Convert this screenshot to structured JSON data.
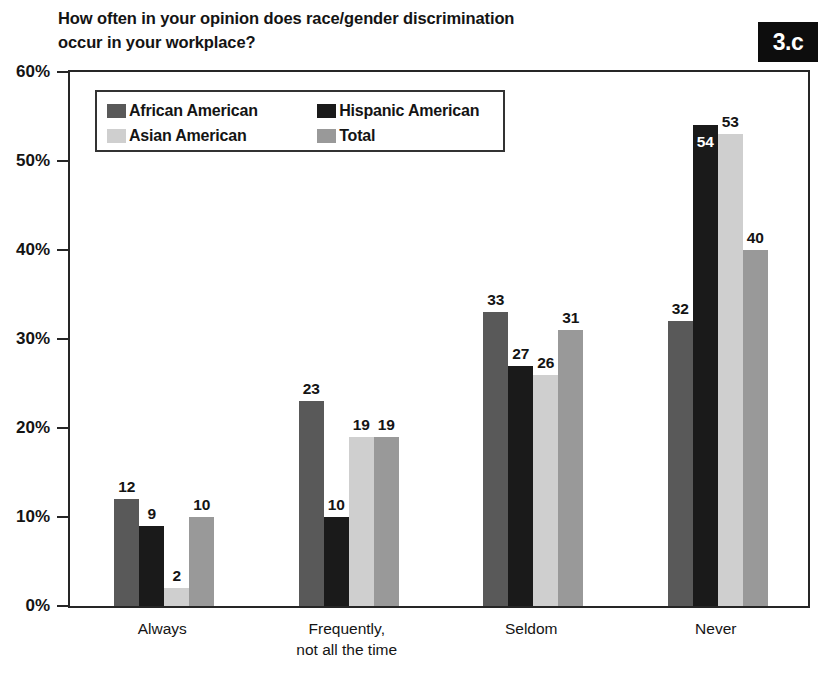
{
  "header": {
    "title": "How often in your opinion does race/gender discrimination\noccur in your workplace?",
    "badge": "3.c"
  },
  "legend": {
    "position": "inside-top-left",
    "entries": [
      {
        "label": "African American",
        "color": "#595959"
      },
      {
        "label": "Hispanic American",
        "color": "#1a1a1a"
      },
      {
        "label": "Asian American",
        "color": "#cfcfcf"
      },
      {
        "label": "Total",
        "color": "#999999"
      }
    ]
  },
  "axes": {
    "y_ticks": [
      "0%",
      "10%",
      "20%",
      "30%",
      "40%",
      "50%",
      "60%"
    ],
    "y_tick_values": [
      0,
      10,
      20,
      30,
      40,
      50,
      60
    ],
    "x_ticks": [
      "Always",
      "Frequently,\nnot all the time",
      "Seldom",
      "Never"
    ]
  },
  "chart_data": {
    "type": "bar",
    "title": "How often in your opinion does race/gender discrimination occur in your workplace?",
    "xlabel": "",
    "ylabel": "",
    "ylim": [
      0,
      60
    ],
    "grid": false,
    "legend_position": "upper left (inside plot)",
    "categories": [
      "Always",
      "Frequently, not all the time",
      "Seldom",
      "Never"
    ],
    "series": [
      {
        "name": "African American",
        "color": "#595959",
        "values": [
          12,
          23,
          33,
          32
        ]
      },
      {
        "name": "Hispanic American",
        "color": "#1a1a1a",
        "values": [
          9,
          10,
          27,
          54
        ]
      },
      {
        "name": "Asian American",
        "color": "#cfcfcf",
        "values": [
          2,
          19,
          26,
          53
        ]
      },
      {
        "name": "Total",
        "color": "#999999",
        "values": [
          10,
          19,
          31,
          40
        ]
      }
    ],
    "value_label_inside": [
      {
        "series": "Hispanic American",
        "category": "Never",
        "value": 54
      }
    ]
  }
}
